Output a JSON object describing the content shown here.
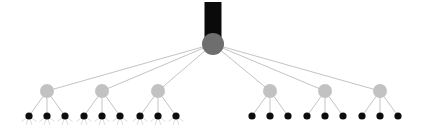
{
  "figure": {
    "name": "hierarchical-tree-diagram",
    "type": "tree",
    "background": "#ffffff",
    "width": 421,
    "height": 130
  },
  "style": {
    "root_fill": "#6e6e6e",
    "internal_fill": "#c2c2c2",
    "leaf_fill": "#0d0d0d",
    "bar_fill": "#0a0a0a",
    "edge_color": "#b4b4b4",
    "whisker_color": "#cfcfcf",
    "edge_width": 0.8,
    "whisker_width": 0.7,
    "root_radius": 11,
    "internal_radius": 7,
    "leaf_radius": 3.6
  },
  "chart_data": {
    "type": "tree",
    "title": "",
    "levels": 3,
    "counts": {
      "root": 1,
      "internal": 6,
      "leaves": 18
    },
    "root": {
      "id": "root",
      "label": "",
      "x": 213,
      "y": 44,
      "radius": 11,
      "color": "#6e6e6e"
    },
    "root_bar": {
      "id": "root-bar",
      "label": "",
      "x": 204.5,
      "y": 2,
      "width": 17,
      "height": 38,
      "color": "#0a0a0a"
    },
    "internal_nodes": [
      {
        "id": "n1",
        "label": "",
        "x": 47,
        "y": 91,
        "radius": 7,
        "color": "#c2c2c2",
        "group": "left",
        "leaf_count": 3,
        "whiskers": true
      },
      {
        "id": "n2",
        "label": "",
        "x": 102,
        "y": 91,
        "radius": 7,
        "color": "#c2c2c2",
        "group": "left",
        "leaf_count": 3,
        "whiskers": true
      },
      {
        "id": "n3",
        "label": "",
        "x": 158,
        "y": 91,
        "radius": 7,
        "color": "#c2c2c2",
        "group": "left",
        "leaf_count": 3,
        "whiskers": true
      },
      {
        "id": "n4",
        "label": "",
        "x": 270,
        "y": 91,
        "radius": 7,
        "color": "#c2c2c2",
        "group": "right",
        "leaf_count": 3,
        "whiskers": false
      },
      {
        "id": "n5",
        "label": "",
        "x": 325,
        "y": 91,
        "radius": 7,
        "color": "#c2c2c2",
        "group": "right",
        "leaf_count": 3,
        "whiskers": false
      },
      {
        "id": "n6",
        "label": "",
        "x": 380,
        "y": 91,
        "radius": 7,
        "color": "#c2c2c2",
        "group": "right",
        "leaf_count": 3,
        "whiskers": false
      }
    ],
    "leaves": [
      {
        "id": "l1",
        "parent": "n1",
        "x": 29,
        "y": 116,
        "radius": 3.6,
        "color": "#0d0d0d",
        "whiskers": true
      },
      {
        "id": "l2",
        "parent": "n1",
        "x": 47,
        "y": 116,
        "radius": 3.6,
        "color": "#0d0d0d",
        "whiskers": true
      },
      {
        "id": "l3",
        "parent": "n1",
        "x": 65,
        "y": 116,
        "radius": 3.6,
        "color": "#0d0d0d",
        "whiskers": true
      },
      {
        "id": "l4",
        "parent": "n2",
        "x": 84,
        "y": 116,
        "radius": 3.6,
        "color": "#0d0d0d",
        "whiskers": true
      },
      {
        "id": "l5",
        "parent": "n2",
        "x": 102,
        "y": 116,
        "radius": 3.6,
        "color": "#0d0d0d",
        "whiskers": true
      },
      {
        "id": "l6",
        "parent": "n2",
        "x": 120,
        "y": 116,
        "radius": 3.6,
        "color": "#0d0d0d",
        "whiskers": true
      },
      {
        "id": "l7",
        "parent": "n3",
        "x": 140,
        "y": 116,
        "radius": 3.6,
        "color": "#0d0d0d",
        "whiskers": true
      },
      {
        "id": "l8",
        "parent": "n3",
        "x": 158,
        "y": 116,
        "radius": 3.6,
        "color": "#0d0d0d",
        "whiskers": true
      },
      {
        "id": "l9",
        "parent": "n3",
        "x": 176,
        "y": 116,
        "radius": 3.6,
        "color": "#0d0d0d",
        "whiskers": true
      },
      {
        "id": "l10",
        "parent": "n4",
        "x": 252,
        "y": 116,
        "radius": 3.6,
        "color": "#0d0d0d",
        "whiskers": false
      },
      {
        "id": "l11",
        "parent": "n4",
        "x": 270,
        "y": 116,
        "radius": 3.6,
        "color": "#0d0d0d",
        "whiskers": false
      },
      {
        "id": "l12",
        "parent": "n4",
        "x": 288,
        "y": 116,
        "radius": 3.6,
        "color": "#0d0d0d",
        "whiskers": false
      },
      {
        "id": "l13",
        "parent": "n5",
        "x": 307,
        "y": 116,
        "radius": 3.6,
        "color": "#0d0d0d",
        "whiskers": false
      },
      {
        "id": "l14",
        "parent": "n5",
        "x": 325,
        "y": 116,
        "radius": 3.6,
        "color": "#0d0d0d",
        "whiskers": false
      },
      {
        "id": "l15",
        "parent": "n5",
        "x": 343,
        "y": 116,
        "radius": 3.6,
        "color": "#0d0d0d",
        "whiskers": false
      },
      {
        "id": "l16",
        "parent": "n6",
        "x": 362,
        "y": 116,
        "radius": 3.6,
        "color": "#0d0d0d",
        "whiskers": false
      },
      {
        "id": "l17",
        "parent": "n6",
        "x": 380,
        "y": 116,
        "radius": 3.6,
        "color": "#0d0d0d",
        "whiskers": false
      },
      {
        "id": "l18",
        "parent": "n6",
        "x": 398,
        "y": 116,
        "radius": 3.6,
        "color": "#0d0d0d",
        "whiskers": false
      }
    ],
    "edges": [
      {
        "from": "root",
        "to": "n1"
      },
      {
        "from": "root",
        "to": "n2"
      },
      {
        "from": "root",
        "to": "n3"
      },
      {
        "from": "root",
        "to": "n4"
      },
      {
        "from": "root",
        "to": "n5"
      },
      {
        "from": "root",
        "to": "n6"
      },
      {
        "from": "n1",
        "to": "l1"
      },
      {
        "from": "n1",
        "to": "l2"
      },
      {
        "from": "n1",
        "to": "l3"
      },
      {
        "from": "n2",
        "to": "l4"
      },
      {
        "from": "n2",
        "to": "l5"
      },
      {
        "from": "n2",
        "to": "l6"
      },
      {
        "from": "n3",
        "to": "l7"
      },
      {
        "from": "n3",
        "to": "l8"
      },
      {
        "from": "n3",
        "to": "l9"
      },
      {
        "from": "n4",
        "to": "l10"
      },
      {
        "from": "n4",
        "to": "l11"
      },
      {
        "from": "n4",
        "to": "l12"
      },
      {
        "from": "n5",
        "to": "l13"
      },
      {
        "from": "n5",
        "to": "l14"
      },
      {
        "from": "n5",
        "to": "l15"
      },
      {
        "from": "n6",
        "to": "l16"
      },
      {
        "from": "n6",
        "to": "l17"
      },
      {
        "from": "n6",
        "to": "l18"
      }
    ],
    "whisker_spec": {
      "count": 4,
      "length": 9,
      "spread_deg": 54,
      "color": "#cfcfcf"
    }
  }
}
